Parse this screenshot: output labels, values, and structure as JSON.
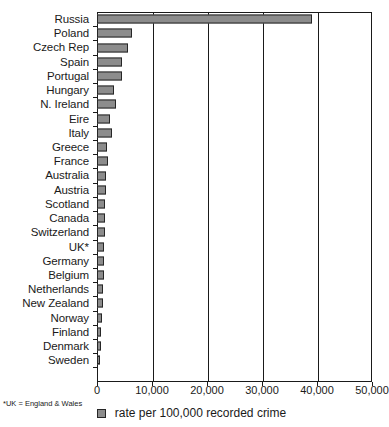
{
  "chart_data": {
    "type": "bar",
    "orientation": "horizontal",
    "title": "",
    "xlabel": "",
    "ylabel": "",
    "xlim": [
      0,
      50000
    ],
    "grid": true,
    "legend_position": "bottom-center",
    "legend": [
      "rate per 100,000 recorded crime"
    ],
    "footnote": "*UK = England & Wales",
    "xticks": [
      "0",
      "10,000",
      "20,000",
      "30,000",
      "40,000",
      "50,000"
    ],
    "xtick_values": [
      0,
      10000,
      20000,
      30000,
      40000,
      50000
    ],
    "categories": [
      "Russia",
      "Poland",
      "Czech Rep",
      "Spain",
      "Portugal",
      "Hungary",
      "N. Ireland",
      "Eire",
      "Italy",
      "Greece",
      "France",
      "Australia",
      "Austria",
      "Scotland",
      "Canada",
      "Switzerland",
      "UK*",
      "Germany",
      "Belgium",
      "Netherlands",
      "New Zealand",
      "Norway",
      "Finland",
      "Denmark",
      "Sweden"
    ],
    "values": [
      39000,
      6400,
      5700,
      4500,
      4600,
      3000,
      3500,
      2400,
      2800,
      1900,
      2000,
      1700,
      1600,
      1500,
      1400,
      1400,
      1300,
      1200,
      1200,
      1100,
      1100,
      900,
      800,
      700,
      500
    ],
    "series": [
      {
        "name": "rate per 100,000 recorded crime",
        "color": "#8c8c8c",
        "values": [
          39000,
          6400,
          5700,
          4500,
          4600,
          3000,
          3500,
          2400,
          2800,
          1900,
          2000,
          1700,
          1600,
          1500,
          1400,
          1400,
          1300,
          1200,
          1200,
          1100,
          1100,
          900,
          800,
          700,
          500
        ]
      }
    ]
  },
  "colors": {
    "bar_fill": "#8c8c8c",
    "bar_stroke": "#262626",
    "axis": "#1a1a1a",
    "background": "#ffffff"
  }
}
